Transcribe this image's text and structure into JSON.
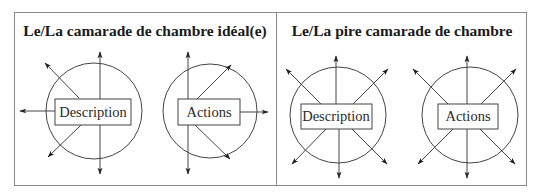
{
  "panels": [
    {
      "title": "Le/La camarade de chambre idéal(e)",
      "diagrams": [
        {
          "label": "Description",
          "arrows": [
            "up",
            "down",
            "left",
            "upper-left",
            "lower-left"
          ]
        },
        {
          "label": "Actions",
          "arrows": [
            "up",
            "down",
            "right",
            "upper-right",
            "lower-right"
          ]
        }
      ]
    },
    {
      "title": "Le/La pire camarade de chambre",
      "diagrams": [
        {
          "label": "Description",
          "arrows": [
            "up",
            "down",
            "upper-left",
            "upper-right",
            "lower-left",
            "lower-right"
          ]
        },
        {
          "label": "Actions",
          "arrows": [
            "up",
            "down",
            "upper-left",
            "upper-right",
            "lower-left",
            "lower-right"
          ]
        }
      ]
    }
  ],
  "colors": {
    "line": "#333333",
    "border": "#8a8a8a",
    "text": "#1a1a1a"
  }
}
